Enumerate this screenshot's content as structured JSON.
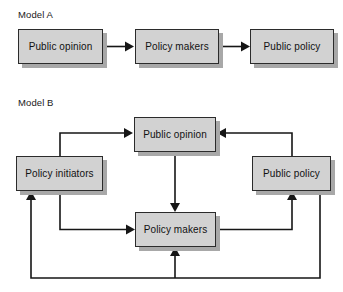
{
  "diagram": {
    "title_a": "Model A",
    "title_b": "Model B",
    "style": {
      "box_fill": "#d2d2d2",
      "box_border": "#2b2b2b",
      "box_shadow": "#a8a8a8",
      "arrow_color": "#161616",
      "background": "#ffffff",
      "text_color": "#111111"
    },
    "models": [
      {
        "id": "model-a",
        "label": "Model A",
        "nodes": [
          {
            "id": "a-public-opinion",
            "label": "Public opinion",
            "x": 18,
            "y": 29,
            "w": 85,
            "h": 35
          },
          {
            "id": "a-policy-makers",
            "label": "Policy makers",
            "x": 135,
            "y": 29,
            "w": 84,
            "h": 35
          },
          {
            "id": "a-public-policy",
            "label": "Public policy",
            "x": 250,
            "y": 29,
            "w": 84,
            "h": 35
          }
        ],
        "edges": [
          {
            "id": "a-e1",
            "from": "a-public-opinion",
            "to": "a-policy-makers",
            "kind": "straight-right"
          },
          {
            "id": "a-e2",
            "from": "a-policy-makers",
            "to": "a-public-policy",
            "kind": "straight-right"
          }
        ]
      },
      {
        "id": "model-b",
        "label": "Model B",
        "nodes": [
          {
            "id": "b-public-opinion",
            "label": "Public opinion",
            "x": 134,
            "y": 117,
            "w": 82,
            "h": 35
          },
          {
            "id": "b-policy-initiators",
            "label": "Policy initiators",
            "x": 16,
            "y": 156,
            "w": 87,
            "h": 35
          },
          {
            "id": "b-public-policy",
            "label": "Public policy",
            "x": 252,
            "y": 156,
            "w": 79,
            "h": 35
          },
          {
            "id": "b-policy-makers",
            "label": "Policy makers",
            "x": 135,
            "y": 212,
            "w": 81,
            "h": 35
          }
        ],
        "edges": [
          {
            "id": "b-e1",
            "from": "b-policy-initiators",
            "to": "b-public-opinion",
            "kind": "up-then-right"
          },
          {
            "id": "b-e2",
            "from": "b-public-policy",
            "to": "b-public-opinion",
            "kind": "up-then-left"
          },
          {
            "id": "b-e3",
            "from": "b-public-opinion",
            "to": "b-policy-makers",
            "kind": "straight-down"
          },
          {
            "id": "b-e4",
            "from": "b-policy-initiators",
            "to": "b-policy-makers",
            "kind": "down-then-right"
          },
          {
            "id": "b-e5",
            "from": "b-policy-makers",
            "to": "b-public-policy",
            "kind": "right-then-up"
          },
          {
            "id": "b-e6",
            "from": "b-public-policy",
            "to": "b-policy-initiators",
            "kind": "down-around-left-up"
          },
          {
            "id": "b-e7",
            "from": "b-public-policy",
            "to": "b-policy-makers",
            "kind": "down-then-up-center"
          }
        ]
      }
    ]
  }
}
